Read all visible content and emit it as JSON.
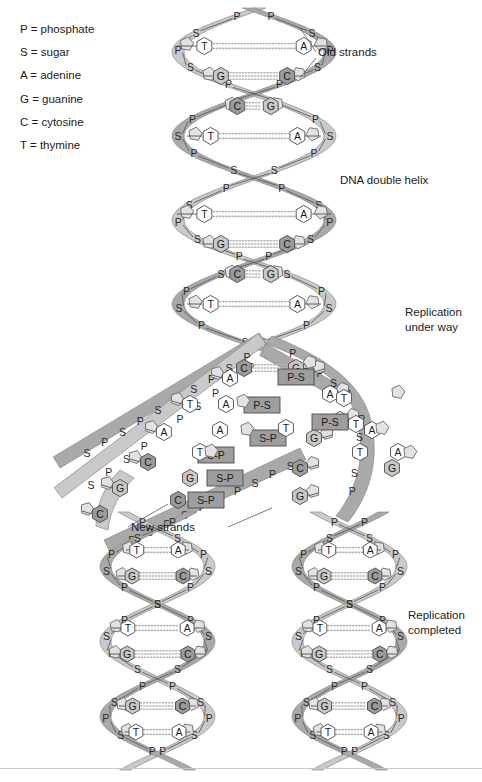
{
  "figure": {
    "background": "#ffffff"
  },
  "legend": {
    "name": "abbreviation-key",
    "items": [
      {
        "symbol": "P",
        "term": "phosphate",
        "text": "P = phosphate"
      },
      {
        "symbol": "S",
        "term": "sugar",
        "text": "S = sugar"
      },
      {
        "symbol": "A",
        "term": "adenine",
        "text": "A = adenine"
      },
      {
        "symbol": "G",
        "term": "guanine",
        "text": "G = guanine"
      },
      {
        "symbol": "C",
        "term": "cytosine",
        "text": "C = cytosine"
      },
      {
        "symbol": "T",
        "term": "thymine",
        "text": "T = thymine"
      }
    ]
  },
  "annotations": {
    "old_strands": "Old strands",
    "dna_double_helix": "DNA double helix",
    "replication_under_way": "Replication\nunder way",
    "new_strands": "New strands",
    "replication_completed": "Replication\ncompleted"
  },
  "colors": {
    "ribbon_front": "#a9a9a9",
    "ribbon_back": "#c9c9c9",
    "ribbon_edge": "#8a8a8a",
    "base_light": "#ffffff",
    "base_guanine": "#c8c8c8",
    "base_cytosine": "#9a9a9a",
    "sugar_pentagon": "#e2e2e2",
    "free_nucleotide_box": "#9e9e9e",
    "hbond_dots": "#b5b5b5",
    "text": "#1b1b1b",
    "rule": "#c9c9c9"
  },
  "backbone_letters": {
    "phosphate": "P",
    "sugar": "S"
  },
  "chart_data": {
    "type": "diagram",
    "regions": [
      {
        "id": "parent-helix",
        "label": "DNA double helix",
        "state": "intact double helix",
        "turns": 2,
        "y_range": [
          10,
          345
        ],
        "base_pairs": [
          {
            "left": "T",
            "right": "A",
            "bonds": 2
          },
          {
            "left": "G",
            "right": "C",
            "bonds": 3
          },
          {
            "left": "C",
            "right": "G",
            "bonds": 3
          },
          {
            "left": "T",
            "right": "A",
            "bonds": 2
          }
        ]
      },
      {
        "id": "replication-fork",
        "label": "Replication under way",
        "state": "strands separated, free nucleotides pairing",
        "y_range": [
          345,
          540
        ],
        "template_bases_left": [
          "A",
          "T",
          "A",
          "C",
          "G",
          "C"
        ],
        "template_bases_right": [
          "A",
          "T",
          "T",
          "A",
          "G",
          "C",
          "G"
        ],
        "free_nucleotides": [
          {
            "label": "P-S",
            "base": "G",
            "x": 296,
            "y": 377
          },
          {
            "label": "P-S",
            "base": "A",
            "x": 262,
            "y": 405
          },
          {
            "label": "S-P",
            "base": "T",
            "x": 268,
            "y": 438
          },
          {
            "label": "S-P",
            "base": "A",
            "x": 216,
            "y": 455
          },
          {
            "label": "P-S",
            "base": "T",
            "x": 330,
            "y": 422
          },
          {
            "label": "S-P",
            "base": "G",
            "x": 225,
            "y": 478
          },
          {
            "label": "S-P",
            "base": "C",
            "x": 206,
            "y": 500
          }
        ]
      },
      {
        "id": "daughter-helix-left",
        "label": "Replication completed",
        "state": "new double helix (one old + one new strand)",
        "y_range": [
          540,
          768
        ],
        "base_pairs": [
          {
            "left": "T",
            "right": "A",
            "bonds": 2
          },
          {
            "left": "G",
            "right": "C",
            "bonds": 3
          },
          {
            "left": "C",
            "right": "G",
            "bonds": 3
          },
          {
            "left": "T",
            "right": "A",
            "bonds": 2
          },
          {
            "left": "G",
            "right": "C",
            "bonds": 3
          },
          {
            "left": "T",
            "right": "A",
            "bonds": 2
          },
          {
            "left": "G",
            "right": "C",
            "bonds": 3
          }
        ]
      },
      {
        "id": "daughter-helix-right",
        "label": "Replication completed",
        "state": "new double helix (one old + one new strand)",
        "y_range": [
          540,
          768
        ],
        "base_pairs": [
          {
            "left": "T",
            "right": "A",
            "bonds": 2
          },
          {
            "left": "G",
            "right": "C",
            "bonds": 3
          },
          {
            "left": "C",
            "right": "G",
            "bonds": 3
          },
          {
            "left": "T",
            "right": "A",
            "bonds": 2
          },
          {
            "left": "G",
            "right": "C",
            "bonds": 3
          },
          {
            "left": "T",
            "right": "A",
            "bonds": 2
          },
          {
            "left": "G",
            "right": "C",
            "bonds": 3
          }
        ]
      }
    ]
  }
}
